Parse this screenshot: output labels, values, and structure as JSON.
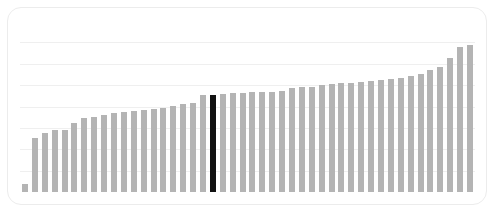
{
  "card": {
    "background": "#ffffff",
    "border_color": "#ececec",
    "corner_radius_px": 14
  },
  "chart_data": {
    "type": "bar",
    "title": "",
    "subtitle": "",
    "xlabel": "",
    "ylabel": "",
    "legend": [],
    "annotations": [],
    "grid": {
      "horizontal": true,
      "vertical": false,
      "color": "#efefef",
      "count": 8,
      "y_values": [
        0,
        1,
        2,
        3,
        4,
        5,
        6,
        7
      ]
    },
    "ylim": [
      0,
      8
    ],
    "xlim": [
      0,
      46
    ],
    "tick_labels_x": [],
    "tick_labels_y": [],
    "bar_color": "#b4b4b4",
    "highlight_color": "#111111",
    "highlight_index": 19,
    "categories": [
      "1",
      "2",
      "3",
      "4",
      "5",
      "6",
      "7",
      "8",
      "9",
      "10",
      "11",
      "12",
      "13",
      "14",
      "15",
      "16",
      "17",
      "18",
      "19",
      "20",
      "21",
      "22",
      "23",
      "24",
      "25",
      "26",
      "27",
      "28",
      "29",
      "30",
      "31",
      "32",
      "33",
      "34",
      "35",
      "36",
      "37",
      "38",
      "39",
      "40",
      "41",
      "42",
      "43",
      "44",
      "45",
      "46"
    ],
    "values": [
      0.38,
      2.52,
      2.78,
      2.9,
      2.92,
      3.22,
      3.48,
      3.52,
      3.62,
      3.68,
      3.72,
      3.78,
      3.82,
      3.86,
      3.95,
      4.02,
      4.12,
      4.18,
      4.55,
      4.55,
      4.6,
      4.62,
      4.64,
      4.66,
      4.68,
      4.7,
      4.72,
      4.86,
      4.9,
      4.92,
      5.02,
      5.06,
      5.08,
      5.12,
      5.16,
      5.18,
      5.22,
      5.28,
      5.34,
      5.42,
      5.52,
      5.7,
      5.86,
      6.28,
      6.78,
      6.9
    ]
  }
}
